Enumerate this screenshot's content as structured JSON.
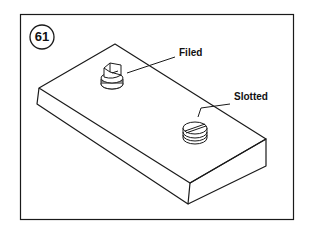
{
  "figure": {
    "number": "61",
    "labels": {
      "filed": "Filed",
      "slotted": "Slotted"
    },
    "colors": {
      "line": "#1a1a1a",
      "background": "#ffffff"
    }
  }
}
